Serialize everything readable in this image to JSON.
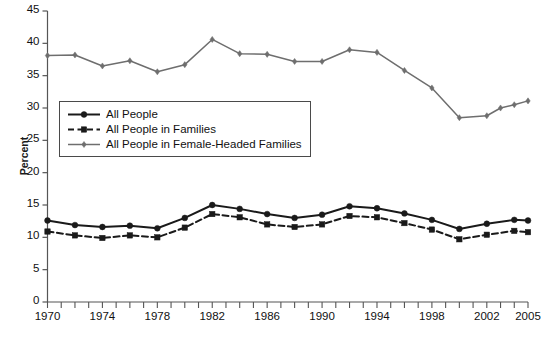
{
  "chart_data": {
    "type": "line",
    "title": "",
    "subtitle": "",
    "xlabel": "",
    "ylabel": "Percent",
    "xlim": [
      1970,
      2005
    ],
    "ylim": [
      0,
      45
    ],
    "ytick_step": 5,
    "yticks": [
      0,
      5,
      10,
      15,
      20,
      25,
      30,
      35,
      40,
      45
    ],
    "xticks_labeled": [
      1970,
      1974,
      1978,
      1982,
      1986,
      1990,
      1994,
      1998,
      2002,
      2005
    ],
    "xticks_minor_every": 1,
    "grid": false,
    "legend_position": "upper-left-inside",
    "series": [
      {
        "name": "All People",
        "color": "#1a1a1a",
        "dash": "solid",
        "marker": "circle",
        "x": [
          1970,
          1972,
          1974,
          1976,
          1978,
          1980,
          1982,
          1984,
          1986,
          1988,
          1990,
          1992,
          1994,
          1996,
          1998,
          2000,
          2002,
          2004,
          2005
        ],
        "values": [
          12.6,
          11.9,
          11.6,
          11.8,
          11.4,
          13.0,
          15.0,
          14.4,
          13.6,
          13.0,
          13.5,
          14.8,
          14.5,
          13.7,
          12.7,
          11.3,
          12.1,
          12.7,
          12.6
        ]
      },
      {
        "name": "All People in Families",
        "color": "#1a1a1a",
        "dash": "dashed",
        "marker": "square",
        "x": [
          1970,
          1972,
          1974,
          1976,
          1978,
          1980,
          1982,
          1984,
          1986,
          1988,
          1990,
          1992,
          1994,
          1996,
          1998,
          2000,
          2002,
          2004,
          2005
        ],
        "values": [
          10.9,
          10.3,
          9.9,
          10.3,
          10.0,
          11.5,
          13.6,
          13.1,
          12.0,
          11.6,
          12.0,
          13.3,
          13.1,
          12.2,
          11.2,
          9.7,
          10.4,
          11.0,
          10.8
        ]
      },
      {
        "name": "All People in Female-Headed Families",
        "color": "#6e6e6e",
        "dash": "solid",
        "marker": "diamond",
        "x": [
          1970,
          1972,
          1974,
          1976,
          1978,
          1980,
          1982,
          1984,
          1986,
          1988,
          1990,
          1992,
          1994,
          1996,
          1998,
          2000,
          2002,
          2003,
          2004,
          2005
        ],
        "values": [
          38.1,
          38.2,
          36.5,
          37.3,
          35.6,
          36.7,
          40.6,
          38.4,
          38.3,
          37.2,
          37.2,
          39.0,
          38.6,
          35.8,
          33.1,
          28.5,
          28.8,
          30.0,
          30.5,
          31.1
        ]
      }
    ]
  },
  "legend": {
    "items": [
      {
        "label": "All People"
      },
      {
        "label": "All People in Families"
      },
      {
        "label": "All People in Female-Headed Families"
      }
    ]
  },
  "axis": {
    "y_title": "Percent"
  }
}
